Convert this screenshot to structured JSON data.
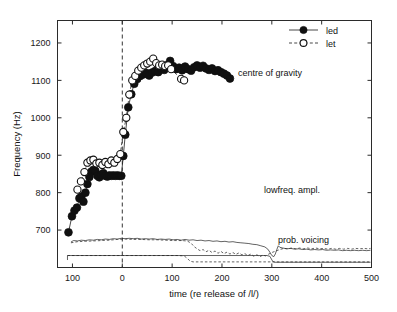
{
  "chart_data": {
    "type": "scatter",
    "title": "",
    "xlabel": "time (re release of /l/)",
    "ylabel": "Frequency (Hz)",
    "xlim": [
      -130,
      500
    ],
    "ylim": [
      600,
      1260
    ],
    "grid": false,
    "xticks": [
      -100,
      0,
      100,
      200,
      300,
      400,
      500
    ],
    "xticklabels": [
      "100",
      "0",
      "100",
      "200",
      "300",
      "400",
      "500"
    ],
    "yticks": [
      700,
      800,
      900,
      1000,
      1100,
      1200
    ],
    "yticklabels": [
      "700",
      "800",
      "900",
      "1000",
      "1100",
      "1200"
    ],
    "legend": {
      "position": "top-right",
      "entries": [
        {
          "label": "led",
          "marker": "filled-circle",
          "line": "solid"
        },
        {
          "label": "let",
          "marker": "open-circle",
          "line": "dashed"
        }
      ]
    },
    "annotations": [
      {
        "text": "centre of gravity",
        "x": 225,
        "y": 1105
      },
      {
        "text": "lowfreq. ampl.",
        "x": 250,
        "y": 690
      },
      {
        "text": "prob. voicing",
        "x": 265,
        "y": 627
      }
    ],
    "reference_lines": [
      {
        "orientation": "vertical",
        "x": 0,
        "style": "dashed"
      }
    ],
    "series": [
      {
        "name": "led",
        "marker": "filled-circle",
        "line": "solid",
        "points": [
          [
            -108,
            694
          ],
          [
            -101,
            737
          ],
          [
            -96,
            752
          ],
          [
            -91,
            760
          ],
          [
            -86,
            785
          ],
          [
            -82,
            790
          ],
          [
            -78,
            776
          ],
          [
            -74,
            800
          ],
          [
            -70,
            823
          ],
          [
            -66,
            842
          ],
          [
            -62,
            856
          ],
          [
            -58,
            861
          ],
          [
            -54,
            858
          ],
          [
            -50,
            845
          ],
          [
            -46,
            841
          ],
          [
            -42,
            848
          ],
          [
            -38,
            852
          ],
          [
            -34,
            845
          ],
          [
            -30,
            843
          ],
          [
            -26,
            846
          ],
          [
            -22,
            845
          ],
          [
            -18,
            846
          ],
          [
            -14,
            845
          ],
          [
            -10,
            846
          ],
          [
            -6,
            845
          ],
          [
            -2,
            845
          ],
          [
            2,
            898
          ],
          [
            6,
            955
          ],
          [
            12,
            1028
          ],
          [
            18,
            1063
          ],
          [
            24,
            1091
          ],
          [
            30,
            1104
          ],
          [
            36,
            1112
          ],
          [
            42,
            1116
          ],
          [
            48,
            1120
          ],
          [
            54,
            1113
          ],
          [
            60,
            1121
          ],
          [
            66,
            1125
          ],
          [
            72,
            1122
          ],
          [
            78,
            1131
          ],
          [
            84,
            1128
          ],
          [
            90,
            1141
          ],
          [
            96,
            1152
          ],
          [
            102,
            1138
          ],
          [
            108,
            1130
          ],
          [
            114,
            1134
          ],
          [
            120,
            1127
          ],
          [
            126,
            1137
          ],
          [
            132,
            1130
          ],
          [
            138,
            1126
          ],
          [
            144,
            1135
          ],
          [
            150,
            1140
          ],
          [
            156,
            1134
          ],
          [
            162,
            1139
          ],
          [
            168,
            1132
          ],
          [
            174,
            1128
          ],
          [
            180,
            1132
          ],
          [
            186,
            1125
          ],
          [
            192,
            1127
          ],
          [
            198,
            1122
          ],
          [
            204,
            1118
          ],
          [
            210,
            1113
          ],
          [
            216,
            1105
          ]
        ]
      },
      {
        "name": "let",
        "marker": "open-circle",
        "line": "dashed",
        "points": [
          [
            -90,
            808
          ],
          [
            -83,
            830
          ],
          [
            -76,
            855
          ],
          [
            -70,
            880
          ],
          [
            -64,
            886
          ],
          [
            -58,
            888
          ],
          [
            -52,
            878
          ],
          [
            -46,
            880
          ],
          [
            -40,
            874
          ],
          [
            -34,
            882
          ],
          [
            -28,
            876
          ],
          [
            -22,
            886
          ],
          [
            -16,
            880
          ],
          [
            -10,
            890
          ],
          [
            -4,
            903
          ],
          [
            2,
            962
          ],
          [
            8,
            1000
          ],
          [
            14,
            1062
          ],
          [
            20,
            1100
          ],
          [
            26,
            1112
          ],
          [
            32,
            1126
          ],
          [
            38,
            1134
          ],
          [
            44,
            1140
          ],
          [
            50,
            1145
          ],
          [
            56,
            1150
          ],
          [
            62,
            1158
          ],
          [
            68,
            1146
          ],
          [
            74,
            1140
          ],
          [
            80,
            1142
          ],
          [
            86,
            1138
          ],
          [
            92,
            1140
          ],
          [
            98,
            1130
          ],
          [
            118,
            1104
          ],
          [
            124,
            1100
          ]
        ]
      }
    ],
    "lowfreq_amplitude": {
      "label": "lowfreq. ampl.",
      "led": {
        "line": "solid",
        "points": [
          [
            -103,
            668
          ],
          [
            -98,
            672
          ],
          [
            -90,
            671
          ],
          [
            -82,
            673
          ],
          [
            -74,
            672
          ],
          [
            -66,
            674
          ],
          [
            -58,
            673
          ],
          [
            -50,
            675
          ],
          [
            -42,
            674
          ],
          [
            -34,
            676
          ],
          [
            -26,
            675
          ],
          [
            -18,
            677
          ],
          [
            -10,
            676
          ],
          [
            -2,
            678
          ],
          [
            6,
            677
          ],
          [
            14,
            678
          ],
          [
            22,
            677
          ],
          [
            30,
            678
          ],
          [
            38,
            676
          ],
          [
            46,
            677
          ],
          [
            54,
            676
          ],
          [
            62,
            677
          ],
          [
            70,
            675
          ],
          [
            78,
            676
          ],
          [
            86,
            675
          ],
          [
            94,
            676
          ],
          [
            102,
            674
          ],
          [
            110,
            675
          ],
          [
            118,
            673
          ],
          [
            126,
            675
          ],
          [
            134,
            673
          ],
          [
            142,
            674
          ],
          [
            150,
            672
          ],
          [
            158,
            673
          ],
          [
            166,
            671
          ],
          [
            174,
            672
          ],
          [
            182,
            670
          ],
          [
            190,
            671
          ],
          [
            198,
            669
          ],
          [
            206,
            670
          ],
          [
            214,
            668
          ],
          [
            222,
            669
          ],
          [
            230,
            667
          ],
          [
            238,
            666
          ],
          [
            246,
            665
          ],
          [
            254,
            664
          ],
          [
            262,
            662
          ],
          [
            270,
            661
          ],
          [
            278,
            658
          ],
          [
            286,
            655
          ],
          [
            292,
            649
          ],
          [
            296,
            641
          ],
          [
            300,
            632
          ],
          [
            304,
            629
          ],
          [
            307,
            636
          ],
          [
            310,
            648
          ],
          [
            313,
            658
          ],
          [
            316,
            654
          ],
          [
            322,
            652
          ],
          [
            330,
            650
          ],
          [
            338,
            651
          ],
          [
            346,
            649
          ],
          [
            354,
            650
          ],
          [
            362,
            648
          ],
          [
            370,
            649
          ],
          [
            378,
            647
          ],
          [
            386,
            648
          ],
          [
            394,
            647
          ],
          [
            402,
            648
          ],
          [
            410,
            646
          ],
          [
            418,
            647
          ],
          [
            426,
            646
          ],
          [
            434,
            647
          ],
          [
            442,
            645
          ],
          [
            450,
            646
          ],
          [
            458,
            645
          ],
          [
            466,
            646
          ],
          [
            474,
            645
          ],
          [
            482,
            646
          ],
          [
            490,
            645
          ],
          [
            498,
            646
          ]
        ]
      },
      "let": {
        "line": "dashed",
        "points": [
          [
            -103,
            666
          ],
          [
            -90,
            669
          ],
          [
            -74,
            670
          ],
          [
            -58,
            671
          ],
          [
            -42,
            672
          ],
          [
            -26,
            673
          ],
          [
            -10,
            675
          ],
          [
            6,
            676
          ],
          [
            22,
            675
          ],
          [
            38,
            675
          ],
          [
            54,
            674
          ],
          [
            70,
            674
          ],
          [
            86,
            673
          ],
          [
            102,
            672
          ],
          [
            118,
            672
          ],
          [
            130,
            671
          ],
          [
            138,
            665
          ],
          [
            144,
            656
          ],
          [
            150,
            650
          ],
          [
            156,
            645
          ],
          [
            162,
            648
          ],
          [
            168,
            642
          ],
          [
            174,
            646
          ],
          [
            180,
            640
          ],
          [
            186,
            644
          ],
          [
            192,
            638
          ],
          [
            198,
            643
          ],
          [
            204,
            637
          ],
          [
            210,
            641
          ],
          [
            216,
            636
          ],
          [
            222,
            640
          ],
          [
            228,
            635
          ],
          [
            234,
            639
          ],
          [
            240,
            634
          ],
          [
            246,
            637
          ],
          [
            252,
            632
          ],
          [
            258,
            636
          ],
          [
            264,
            630
          ],
          [
            270,
            634
          ],
          [
            276,
            629
          ],
          [
            282,
            633
          ],
          [
            288,
            631
          ],
          [
            294,
            636
          ],
          [
            300,
            640
          ],
          [
            308,
            644
          ],
          [
            316,
            648
          ],
          [
            324,
            651
          ],
          [
            332,
            650
          ],
          [
            340,
            652
          ],
          [
            348,
            650
          ],
          [
            356,
            652
          ],
          [
            364,
            650
          ],
          [
            372,
            652
          ],
          [
            380,
            650
          ],
          [
            388,
            652
          ],
          [
            396,
            650
          ],
          [
            404,
            651
          ],
          [
            412,
            649
          ],
          [
            420,
            651
          ],
          [
            428,
            649
          ],
          [
            436,
            651
          ],
          [
            444,
            649
          ],
          [
            452,
            651
          ],
          [
            460,
            649
          ],
          [
            468,
            651
          ],
          [
            476,
            650
          ],
          [
            484,
            651
          ],
          [
            492,
            650
          ],
          [
            498,
            651
          ]
        ]
      }
    },
    "probability_voicing": {
      "label": "prob. voicing",
      "led": {
        "line": "solid",
        "points": [
          [
            -110,
            620
          ],
          [
            -110,
            632
          ],
          [
            0,
            632
          ],
          [
            120,
            632
          ],
          [
            290,
            632
          ],
          [
            296,
            630
          ],
          [
            302,
            616
          ],
          [
            306,
            614
          ],
          [
            400,
            614
          ],
          [
            498,
            614
          ]
        ]
      },
      "let": {
        "line": "dashed",
        "points": [
          [
            -110,
            632
          ],
          [
            0,
            632
          ],
          [
            110,
            632
          ],
          [
            124,
            631
          ],
          [
            130,
            625
          ],
          [
            136,
            617
          ],
          [
            142,
            615
          ],
          [
            200,
            615
          ],
          [
            300,
            615
          ],
          [
            400,
            615
          ],
          [
            498,
            615
          ]
        ]
      }
    }
  },
  "axis": {
    "y_title": "Frequency (Hz)",
    "x_title": "time (re release of /l/)"
  },
  "legend": {
    "led_label": "led",
    "let_label": "let"
  },
  "annotations": {
    "cog": "centre of gravity",
    "lowfreq": "lowfreq. ampl.",
    "voicing": "prob. voicing"
  },
  "colors": {
    "line": "#1a1a1a",
    "marker_fill": "#101010",
    "marker_open_fill": "#ffffff",
    "background": "#ffffff",
    "axis": "#2b2b2b"
  }
}
